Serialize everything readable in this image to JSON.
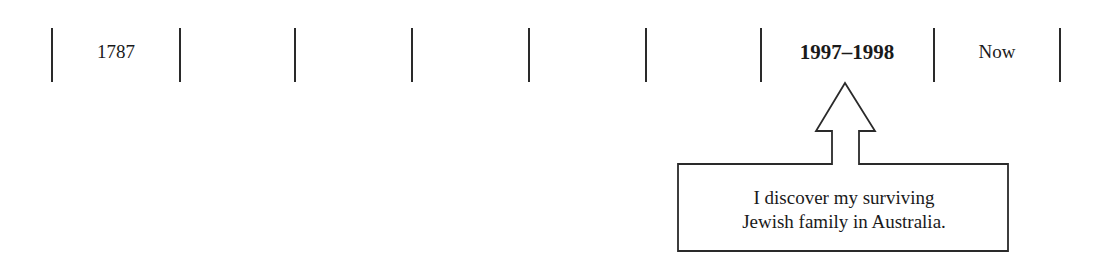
{
  "timeline": {
    "ticks_x": [
      52,
      180,
      295,
      412,
      529,
      646,
      761,
      934,
      1060
    ],
    "labels": [
      {
        "text": "1787",
        "x": 116,
        "bold": false
      },
      {
        "text": "1997–1998",
        "x": 847,
        "bold": true
      },
      {
        "text": "Now",
        "x": 997,
        "bold": false
      }
    ]
  },
  "callout": {
    "line1": "I discover my surviving",
    "line2": "Jewish family in Australia.",
    "stroke_color": "#2a2a2a"
  }
}
